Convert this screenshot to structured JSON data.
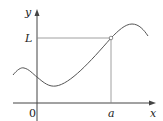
{
  "diagram": {
    "x_axis_label": "x",
    "y_axis_label": "y",
    "origin_label": "0",
    "point_x_label": "a",
    "point_y_label": "L",
    "colors": {
      "axes": "#444444",
      "curve": "#555555",
      "guides": "#888888",
      "text": "#222222"
    }
  }
}
